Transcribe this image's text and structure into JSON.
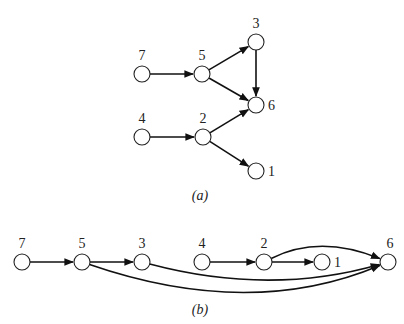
{
  "diagram_a": {
    "caption": "(a)",
    "nodes": [
      {
        "id": "7",
        "label": "7",
        "x": 142,
        "y": 74,
        "lx": 142,
        "ly": 60,
        "anchor": "middle"
      },
      {
        "id": "5",
        "label": "5",
        "x": 202,
        "y": 74,
        "lx": 202,
        "ly": 60,
        "anchor": "middle"
      },
      {
        "id": "3",
        "label": "3",
        "x": 256,
        "y": 42,
        "lx": 256,
        "ly": 28,
        "anchor": "middle"
      },
      {
        "id": "6",
        "label": "6",
        "x": 256,
        "y": 105,
        "lx": 268,
        "ly": 110,
        "anchor": "start"
      },
      {
        "id": "4",
        "label": "4",
        "x": 142,
        "y": 137,
        "lx": 142,
        "ly": 123,
        "anchor": "middle"
      },
      {
        "id": "2",
        "label": "2",
        "x": 203,
        "y": 137,
        "lx": 203,
        "ly": 123,
        "anchor": "middle"
      },
      {
        "id": "1",
        "label": "1",
        "x": 256,
        "y": 171,
        "lx": 268,
        "ly": 176,
        "anchor": "start"
      }
    ],
    "edges": [
      {
        "from": "7",
        "to": "5"
      },
      {
        "from": "5",
        "to": "3"
      },
      {
        "from": "5",
        "to": "6"
      },
      {
        "from": "3",
        "to": "6"
      },
      {
        "from": "4",
        "to": "2"
      },
      {
        "from": "2",
        "to": "6"
      },
      {
        "from": "2",
        "to": "1"
      }
    ]
  },
  "diagram_b": {
    "caption": "(b)",
    "nodes": [
      {
        "id": "7",
        "label": "7",
        "x": 22,
        "y": 262,
        "lx": 22,
        "ly": 248,
        "anchor": "middle"
      },
      {
        "id": "5",
        "label": "5",
        "x": 82,
        "y": 262,
        "lx": 82,
        "ly": 248,
        "anchor": "middle"
      },
      {
        "id": "3",
        "label": "3",
        "x": 142,
        "y": 262,
        "lx": 142,
        "ly": 248,
        "anchor": "middle"
      },
      {
        "id": "4",
        "label": "4",
        "x": 202,
        "y": 262,
        "lx": 202,
        "ly": 248,
        "anchor": "middle"
      },
      {
        "id": "2",
        "label": "2",
        "x": 264,
        "y": 262,
        "lx": 264,
        "ly": 248,
        "anchor": "middle"
      },
      {
        "id": "1",
        "label": "1",
        "x": 322,
        "y": 262,
        "lx": 334,
        "ly": 267,
        "anchor": "start"
      },
      {
        "id": "6",
        "label": "6",
        "x": 388,
        "y": 262,
        "lx": 390,
        "ly": 248,
        "anchor": "middle"
      }
    ],
    "edges": [
      {
        "from": "7",
        "to": "5",
        "curve": null
      },
      {
        "from": "5",
        "to": "3",
        "curve": null
      },
      {
        "from": "4",
        "to": "2",
        "curve": null
      },
      {
        "from": "2",
        "to": "1",
        "curve": null
      },
      {
        "from": "2",
        "to": "6",
        "curve": [
          320,
          234
        ]
      },
      {
        "from": "3",
        "to": "6",
        "curve": [
          270,
          296
        ]
      },
      {
        "from": "5",
        "to": "6",
        "curve": [
          250,
          320
        ]
      }
    ]
  },
  "style": {
    "node_radius": 8,
    "stroke_color": "#111111",
    "background": "#ffffff"
  }
}
